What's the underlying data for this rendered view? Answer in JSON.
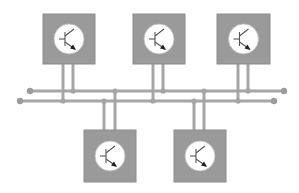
{
  "diagram": {
    "colors": {
      "background": "#ffffff",
      "module_fill": "#9a9a9a",
      "module_border": "#8c8c8c",
      "circle_fill": "#ffffff",
      "wire": "#a6a6a6",
      "node": "#9c9c9c",
      "symbol": "#555555"
    },
    "buses": [
      {
        "id": "bus-upper",
        "x1": 30,
        "x2": 284,
        "y": 91
      },
      {
        "id": "bus-lower",
        "x1": 20,
        "x2": 274,
        "y": 101
      }
    ],
    "modules": [
      {
        "id": "module-top-1",
        "x": 43,
        "y": 14,
        "w": 52,
        "h": 50,
        "icon": "transistor-icon",
        "legs": [
          {
            "x": 63,
            "bus": "bus-lower"
          },
          {
            "x": 73,
            "bus": "bus-upper"
          }
        ]
      },
      {
        "id": "module-top-2",
        "x": 133,
        "y": 14,
        "w": 52,
        "h": 50,
        "icon": "transistor-icon",
        "legs": [
          {
            "x": 153,
            "bus": "bus-lower"
          },
          {
            "x": 163,
            "bus": "bus-upper"
          }
        ]
      },
      {
        "id": "module-top-3",
        "x": 217,
        "y": 14,
        "w": 53,
        "h": 50,
        "icon": "transistor-icon",
        "legs": [
          {
            "x": 238,
            "bus": "bus-lower"
          },
          {
            "x": 248,
            "bus": "bus-upper"
          }
        ]
      },
      {
        "id": "module-bottom-1",
        "x": 84,
        "y": 130,
        "w": 52,
        "h": 52,
        "icon": "transistor-icon",
        "legs": [
          {
            "x": 104,
            "bus": "bus-lower"
          },
          {
            "x": 115,
            "bus": "bus-upper"
          }
        ]
      },
      {
        "id": "module-bottom-2",
        "x": 174,
        "y": 130,
        "w": 52,
        "h": 52,
        "icon": "transistor-icon",
        "legs": [
          {
            "x": 194,
            "bus": "bus-lower"
          },
          {
            "x": 204,
            "bus": "bus-upper"
          }
        ]
      }
    ]
  }
}
